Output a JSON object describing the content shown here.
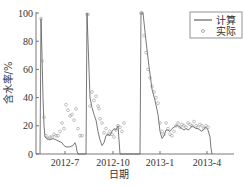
{
  "chart_data": {
    "type": "line",
    "title": "",
    "xlabel": "日期",
    "ylabel": "含水率/%",
    "ylim": [
      0,
      100
    ],
    "yticks": [
      0,
      20,
      40,
      60,
      80,
      100
    ],
    "xtick_labels": [
      "2012-7",
      "2012-10",
      "2013-1",
      "2013-4"
    ],
    "grid": false,
    "legend_position": "upper right",
    "legend": [
      "计算",
      "实际"
    ],
    "series": [
      {
        "name": "计算",
        "style": "line",
        "color": "#555555",
        "points": [
          [
            40,
            0
          ],
          [
            41,
            96
          ],
          [
            42,
            70
          ],
          [
            43,
            40
          ],
          [
            44,
            20
          ],
          [
            45,
            12
          ],
          [
            47,
            11
          ],
          [
            50,
            10
          ],
          [
            53,
            11
          ],
          [
            56,
            10
          ],
          [
            59,
            9
          ],
          [
            62,
            8
          ],
          [
            64,
            6
          ],
          [
            66,
            5
          ],
          [
            70,
            5
          ],
          [
            73,
            6
          ],
          [
            75,
            8
          ],
          [
            76,
            6
          ],
          [
            77,
            2
          ],
          [
            78,
            0
          ],
          [
            86,
            0
          ],
          [
            87,
            100
          ],
          [
            88,
            80
          ],
          [
            89,
            60
          ],
          [
            90,
            40
          ],
          [
            92,
            33
          ],
          [
            94,
            28
          ],
          [
            96,
            24
          ],
          [
            98,
            16
          ],
          [
            100,
            10
          ],
          [
            102,
            6
          ],
          [
            104,
            8
          ],
          [
            106,
            13
          ],
          [
            108,
            14
          ],
          [
            110,
            13
          ],
          [
            112,
            16
          ],
          [
            114,
            18
          ],
          [
            116,
            17
          ],
          [
            118,
            20
          ],
          [
            119,
            10
          ],
          [
            120,
            0
          ],
          [
            140,
            0
          ],
          [
            141,
            100
          ],
          [
            143,
            100
          ],
          [
            146,
            80
          ],
          [
            149,
            62
          ],
          [
            152,
            46
          ],
          [
            155,
            38
          ],
          [
            158,
            28
          ],
          [
            160,
            16
          ],
          [
            162,
            11
          ],
          [
            164,
            13
          ],
          [
            166,
            17
          ],
          [
            168,
            17
          ],
          [
            170,
            16
          ],
          [
            172,
            18
          ],
          [
            174,
            19
          ],
          [
            176,
            20
          ],
          [
            178,
            20
          ],
          [
            180,
            19
          ],
          [
            182,
            18
          ],
          [
            184,
            17
          ],
          [
            186,
            18
          ],
          [
            188,
            17
          ],
          [
            190,
            18
          ],
          [
            192,
            20
          ],
          [
            194,
            19
          ],
          [
            196,
            18
          ],
          [
            198,
            18
          ],
          [
            200,
            17
          ],
          [
            202,
            16
          ],
          [
            204,
            18
          ],
          [
            206,
            19
          ],
          [
            208,
            17
          ],
          [
            210,
            12
          ],
          [
            211,
            4
          ],
          [
            212,
            0
          ]
        ]
      },
      {
        "name": "实际",
        "style": "scatter",
        "marker": "circle-open",
        "color": "#888888",
        "points": [
          [
            41,
            96
          ],
          [
            42,
            66
          ],
          [
            44,
            26
          ],
          [
            46,
            13
          ],
          [
            48,
            11
          ],
          [
            50,
            12
          ],
          [
            52,
            12
          ],
          [
            54,
            14
          ],
          [
            56,
            13
          ],
          [
            58,
            13
          ],
          [
            60,
            16
          ],
          [
            62,
            22
          ],
          [
            64,
            18
          ],
          [
            66,
            35
          ],
          [
            68,
            31
          ],
          [
            70,
            27
          ],
          [
            72,
            28
          ],
          [
            74,
            24
          ],
          [
            76,
            32
          ],
          [
            78,
            18
          ],
          [
            80,
            13
          ],
          [
            82,
            13
          ],
          [
            87,
            99
          ],
          [
            88,
            99
          ],
          [
            90,
            34
          ],
          [
            92,
            44
          ],
          [
            94,
            38
          ],
          [
            96,
            41
          ],
          [
            98,
            34
          ],
          [
            99,
            32
          ],
          [
            100,
            25
          ],
          [
            102,
            22
          ],
          [
            104,
            15
          ],
          [
            106,
            18
          ],
          [
            108,
            14
          ],
          [
            110,
            16
          ],
          [
            112,
            14
          ],
          [
            114,
            12
          ],
          [
            116,
            17
          ],
          [
            118,
            20
          ],
          [
            120,
            19
          ],
          [
            122,
            16
          ],
          [
            124,
            22
          ],
          [
            141,
            100
          ],
          [
            142,
            100
          ],
          [
            144,
            84
          ],
          [
            146,
            72
          ],
          [
            148,
            60
          ],
          [
            150,
            54
          ],
          [
            152,
            48
          ],
          [
            154,
            44
          ],
          [
            156,
            40
          ],
          [
            158,
            36
          ],
          [
            160,
            22
          ],
          [
            162,
            16
          ],
          [
            164,
            14
          ],
          [
            166,
            22
          ],
          [
            168,
            18
          ],
          [
            170,
            14
          ],
          [
            172,
            13
          ],
          [
            174,
            16
          ],
          [
            176,
            20
          ],
          [
            178,
            22
          ],
          [
            180,
            19
          ],
          [
            182,
            21
          ],
          [
            184,
            20
          ],
          [
            186,
            19
          ],
          [
            188,
            22
          ],
          [
            190,
            21
          ],
          [
            192,
            20
          ],
          [
            194,
            23
          ],
          [
            196,
            20
          ],
          [
            198,
            19
          ],
          [
            200,
            21
          ],
          [
            202,
            20
          ],
          [
            204,
            18
          ],
          [
            206,
            20
          ],
          [
            208,
            19
          ]
        ]
      }
    ],
    "x_pixel_map": {
      "2012-7": 65,
      "2012-10": 113,
      "2013-1": 160,
      "2013-4": 207
    }
  },
  "axes": {
    "y_title": "含水率/%",
    "x_title": "日期"
  },
  "legend": {
    "line_label": "计算",
    "marker_label": "实际"
  }
}
